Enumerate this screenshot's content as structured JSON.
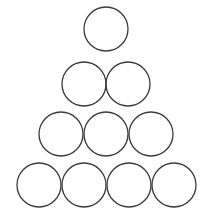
{
  "figure": {
    "shape_name": "circle",
    "total_count": 10,
    "row_counts": [
      1,
      2,
      3,
      4
    ],
    "background_color": "#ffffff",
    "stroke_color": "#3a3a3c",
    "fill_color": "none",
    "stroke_width": 1.3,
    "radius": 22,
    "canvas": {
      "width": 213,
      "height": 217
    }
  },
  "chart_data": {
    "type": "scatter",
    "subtitle": "",
    "xlabel": "",
    "ylabel": "",
    "xlim": [
      0,
      213
    ],
    "ylim": [
      0,
      217
    ],
    "grid": false,
    "legend": "none",
    "marker": "open-circle",
    "marker_diameter": 44,
    "rows": [
      {
        "row": 1,
        "count": 1,
        "cy": 29,
        "cx": [
          106
        ]
      },
      {
        "row": 2,
        "count": 2,
        "cy": 84,
        "cx": [
          84,
          128
        ]
      },
      {
        "row": 3,
        "count": 3,
        "cy": 134,
        "cx": [
          61,
          106,
          151
        ]
      },
      {
        "row": 4,
        "count": 4,
        "cy": 185,
        "cx": [
          39,
          84,
          129,
          174
        ]
      }
    ],
    "points": [
      {
        "id": 1,
        "row": 1,
        "col": 1,
        "x": 106,
        "y": 29,
        "r": 22
      },
      {
        "id": 2,
        "row": 2,
        "col": 1,
        "x": 84,
        "y": 84,
        "r": 22
      },
      {
        "id": 3,
        "row": 2,
        "col": 2,
        "x": 128,
        "y": 84,
        "r": 22
      },
      {
        "id": 4,
        "row": 3,
        "col": 1,
        "x": 61,
        "y": 134,
        "r": 22
      },
      {
        "id": 5,
        "row": 3,
        "col": 2,
        "x": 106,
        "y": 134,
        "r": 22
      },
      {
        "id": 6,
        "row": 3,
        "col": 3,
        "x": 151,
        "y": 134,
        "r": 22
      },
      {
        "id": 7,
        "row": 4,
        "col": 1,
        "x": 39,
        "y": 185,
        "r": 22
      },
      {
        "id": 8,
        "row": 4,
        "col": 2,
        "x": 84,
        "y": 185,
        "r": 22
      },
      {
        "id": 9,
        "row": 4,
        "col": 3,
        "x": 129,
        "y": 185,
        "r": 22
      },
      {
        "id": 10,
        "row": 4,
        "col": 4,
        "x": 174,
        "y": 185,
        "r": 22
      }
    ]
  }
}
